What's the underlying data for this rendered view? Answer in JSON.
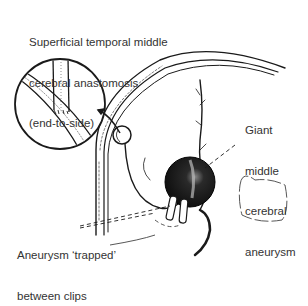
{
  "labels": {
    "anastomosis": {
      "line1": "Superficial temporal middle",
      "line2": "cerebral anastomosis",
      "line3": "(end-to-side)"
    },
    "aneurysm": {
      "line1": "Giant",
      "line2": "middle",
      "line3": "cerebral",
      "line4": "aneurysm"
    },
    "trapped": {
      "line1": "Aneurysm ‘trapped’",
      "line2": "between clips"
    }
  },
  "colors": {
    "ink": "#1a1a1a",
    "text": "#333333",
    "background": "#ffffff"
  }
}
